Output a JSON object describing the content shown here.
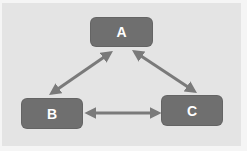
{
  "diagram": {
    "type": "triangle-relationship",
    "colors": {
      "background": "#e4e4e4",
      "border": "#f5f5f5",
      "node_fill": "#6f6f6f",
      "node_text": "#ffffff",
      "edge": "#7a7a7a"
    },
    "nodes": [
      {
        "id": "A",
        "label": "A"
      },
      {
        "id": "B",
        "label": "B"
      },
      {
        "id": "C",
        "label": "C"
      }
    ],
    "edges": [
      {
        "from": "A",
        "to": "B",
        "direction": "bidirectional"
      },
      {
        "from": "A",
        "to": "C",
        "direction": "bidirectional"
      },
      {
        "from": "B",
        "to": "C",
        "direction": "bidirectional"
      }
    ]
  }
}
